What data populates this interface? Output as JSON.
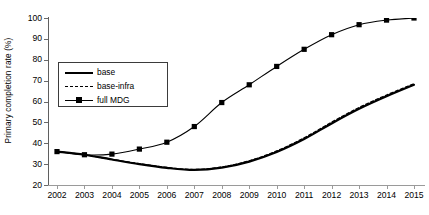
{
  "chart_data": {
    "type": "line",
    "title": "",
    "xlabel": "",
    "ylabel": "Primary completion rate (%)",
    "x": [
      2002,
      2003,
      2004,
      2005,
      2006,
      2007,
      2008,
      2009,
      2010,
      2011,
      2012,
      2013,
      2014,
      2015
    ],
    "categories": [
      "2002",
      "2003",
      "2004",
      "2005",
      "2006",
      "2007",
      "2008",
      "2009",
      "2010",
      "2011",
      "2012",
      "2013",
      "2014",
      "2015"
    ],
    "xlim": [
      2002,
      2015
    ],
    "ylim": [
      20,
      100
    ],
    "yticks": [
      20,
      30,
      40,
      50,
      60,
      70,
      80,
      90,
      100
    ],
    "xticks": [
      "2002",
      "2003",
      "2004",
      "2005",
      "2006",
      "2007",
      "2008",
      "2009",
      "2010",
      "2011",
      "2012",
      "2013",
      "2014",
      "2015"
    ],
    "grid": false,
    "legend_position": "upper-left-inside",
    "series": [
      {
        "name": "base",
        "style": "solid",
        "marker": "none",
        "color": "#000000",
        "values": [
          36.0,
          34.5,
          32.2,
          30.0,
          28.2,
          27.2,
          28.3,
          31.2,
          35.8,
          42.0,
          49.5,
          56.5,
          62.5,
          68.0
        ]
      },
      {
        "name": "base-infra",
        "style": "dashed",
        "marker": "none",
        "color": "#000000",
        "values": [
          36.0,
          34.5,
          32.3,
          30.2,
          28.4,
          27.4,
          28.6,
          31.6,
          36.3,
          42.6,
          50.1,
          57.1,
          63.1,
          68.5
        ]
      },
      {
        "name": "full MDG",
        "style": "solid",
        "marker": "square",
        "color": "#000000",
        "values": [
          36.0,
          34.5,
          34.8,
          37.2,
          40.5,
          48.0,
          59.5,
          68.0,
          76.8,
          85.0,
          92.0,
          96.8,
          99.0,
          100.0
        ]
      }
    ]
  },
  "axes": {
    "y_title": "Primary completion rate (%)",
    "y_tick_labels": [
      "100",
      "90",
      "80",
      "70",
      "60",
      "50",
      "40",
      "30",
      "20"
    ],
    "x_tick_labels": [
      "2002",
      "2003",
      "2004",
      "2005",
      "2006",
      "2007",
      "2008",
      "2009",
      "2010",
      "2011",
      "2012",
      "2013",
      "2014",
      "2015"
    ]
  },
  "legend": {
    "items": [
      {
        "label": "base",
        "sample": "solid-line-sample"
      },
      {
        "label": "base-infra",
        "sample": "dashed-line-sample"
      },
      {
        "label": "full MDG",
        "sample": "square-marker-line-sample"
      }
    ]
  },
  "colors": {
    "line": "#000000",
    "axis": "#6a6a6a",
    "background": "#ffffff"
  }
}
